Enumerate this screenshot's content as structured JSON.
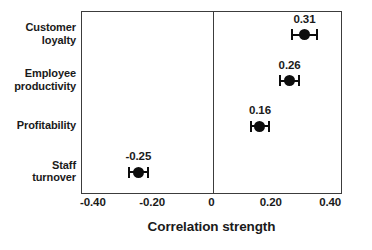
{
  "chart_data": {
    "type": "scatter",
    "subtype": "dot-plot-with-error-bars",
    "title": "",
    "xlabel": "Correlation strength",
    "ylabel": "",
    "xlim": [
      -0.44,
      0.44
    ],
    "xticks": [
      "-0.40",
      "-0.20",
      "0",
      "0.20",
      "0.40"
    ],
    "xtick_values": [
      -0.4,
      -0.2,
      0,
      0.2,
      0.4
    ],
    "grid": false,
    "legend": null,
    "zero_reference_line": 0,
    "categories": [
      "Customer loyalty",
      "Employee productivity",
      "Profitability",
      "Staff turnover"
    ],
    "values": [
      0.31,
      0.26,
      0.16,
      -0.25
    ],
    "point_labels": [
      "0.31",
      "0.26",
      "0.16",
      "-0.25"
    ],
    "error_low": [
      0.265,
      0.225,
      0.125,
      -0.285
    ],
    "error_high": [
      0.355,
      0.295,
      0.195,
      -0.215
    ],
    "points": [
      {
        "category_line1": "Customer",
        "category_line2": "loyalty",
        "value": 0.31,
        "label": "0.31",
        "ci_low": 0.265,
        "ci_high": 0.355
      },
      {
        "category_line1": "Employee",
        "category_line2": "productivity",
        "value": 0.26,
        "label": "0.26",
        "ci_low": 0.225,
        "ci_high": 0.295
      },
      {
        "category_line1": "Profitability",
        "category_line2": "",
        "value": 0.16,
        "label": "0.16",
        "ci_low": 0.125,
        "ci_high": 0.195
      },
      {
        "category_line1": "Staff",
        "category_line2": "turnover",
        "value": -0.25,
        "label": "-0.25",
        "ci_low": -0.285,
        "ci_high": -0.215
      }
    ],
    "colors": {
      "marker": "#0d0d0d",
      "error_bar": "#0d0d0d",
      "axis": "#3c3c3c",
      "text": "#1a1a1a",
      "background": "#ffffff"
    }
  }
}
